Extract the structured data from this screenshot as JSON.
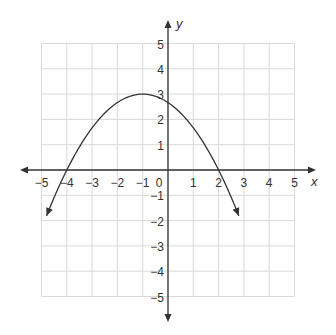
{
  "chart_data": {
    "type": "line",
    "title": "",
    "xlabel": "x",
    "ylabel": "y",
    "xlim": [
      -5,
      5
    ],
    "ylim": [
      -5,
      5
    ],
    "grid": true,
    "x_ticks": [
      "−5",
      "−4",
      "−3",
      "−2",
      "−1",
      "0",
      "1",
      "2",
      "3",
      "4",
      "5"
    ],
    "y_ticks": [
      "5",
      "4",
      "3",
      "2",
      "1",
      "−1",
      "−2",
      "−3",
      "−4",
      "−5"
    ],
    "series": [
      {
        "name": "parabola",
        "equation": "y = -(1/3)(x + 4)(x - 2)",
        "vertex": [
          -1,
          3
        ],
        "x_intercepts": [
          -4,
          2
        ],
        "y_intercept": 2.67,
        "x": [
          -4.8,
          -4,
          -3,
          -2,
          -1,
          0,
          1,
          2,
          2.8
        ],
        "y": [
          -2.13,
          0,
          1.67,
          2.67,
          3,
          2.67,
          1.67,
          0,
          -2.13
        ],
        "arrows_at_ends": true
      }
    ],
    "colors": {
      "curve": "#333333",
      "axes": "#333333",
      "grid": "#d9d9d9"
    }
  }
}
